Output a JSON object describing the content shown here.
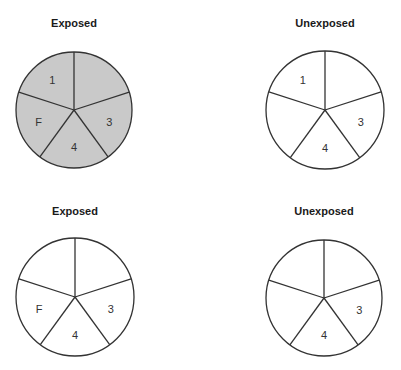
{
  "colors": {
    "stroke": "#333333",
    "filled": "#c9c9c9",
    "empty": "#ffffff"
  },
  "panels": [
    {
      "title": "Exposed",
      "cx": 74,
      "cy": 110,
      "r": 58,
      "shaded": true,
      "segments": [
        {
          "position": "upper-right",
          "label": ""
        },
        {
          "position": "right",
          "label": "3"
        },
        {
          "position": "bottom",
          "label": "4"
        },
        {
          "position": "left",
          "label": "F"
        },
        {
          "position": "upper-left",
          "label": "1"
        }
      ]
    },
    {
      "title": "Unexposed",
      "cx": 325,
      "cy": 110,
      "r": 59,
      "shaded": false,
      "segments": [
        {
          "position": "upper-right",
          "label": ""
        },
        {
          "position": "right",
          "label": "3"
        },
        {
          "position": "bottom",
          "label": "4"
        },
        {
          "position": "left",
          "label": ""
        },
        {
          "position": "upper-left",
          "label": "1"
        }
      ]
    },
    {
      "title": "Exposed",
      "cx": 75,
      "cy": 297,
      "r": 59,
      "shaded": false,
      "segments": [
        {
          "position": "upper-right",
          "label": ""
        },
        {
          "position": "right",
          "label": "3"
        },
        {
          "position": "bottom",
          "label": "4"
        },
        {
          "position": "left",
          "label": "F"
        },
        {
          "position": "upper-left",
          "label": ""
        }
      ]
    },
    {
      "title": "Unexposed",
      "cx": 324,
      "cy": 298,
      "r": 58,
      "shaded": false,
      "segments": [
        {
          "position": "upper-right",
          "label": ""
        },
        {
          "position": "right",
          "label": "3"
        },
        {
          "position": "bottom",
          "label": "4"
        },
        {
          "position": "left",
          "label": ""
        },
        {
          "position": "upper-left",
          "label": ""
        }
      ]
    }
  ],
  "title_positions": [
    {
      "x": 14,
      "y": 17
    },
    {
      "x": 265,
      "y": 17
    },
    {
      "x": 15,
      "y": 205
    },
    {
      "x": 264,
      "y": 205
    }
  ]
}
